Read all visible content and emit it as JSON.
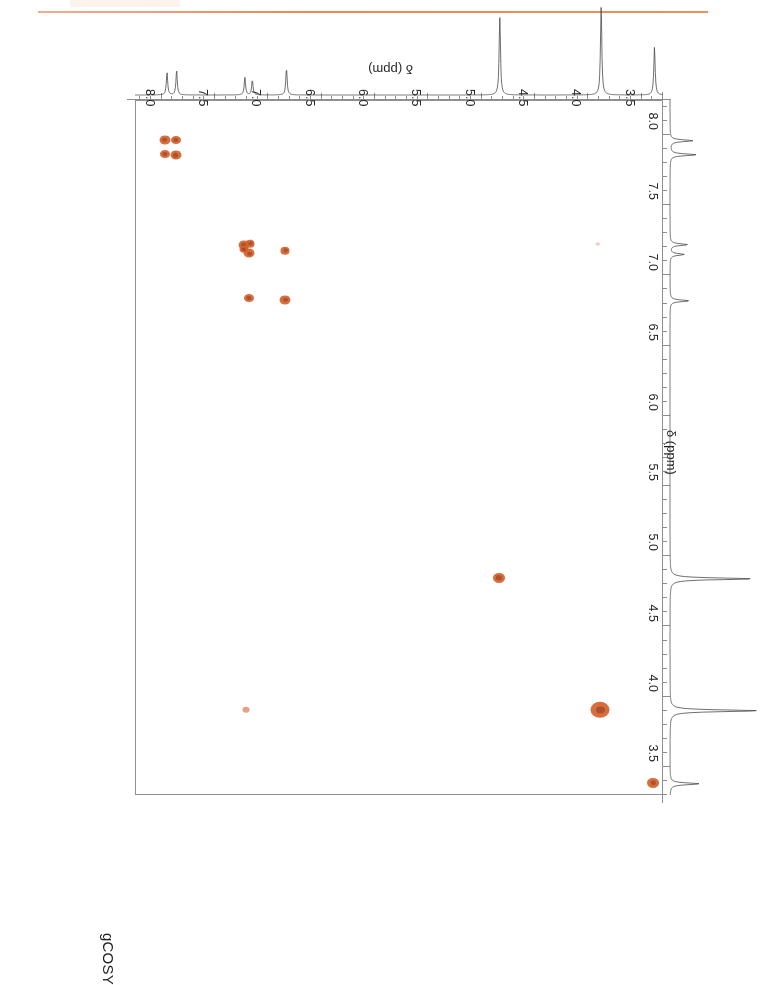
{
  "document": {
    "top_rule_color": "#e8814e"
  },
  "plot": {
    "title": "gCOSY",
    "f2_axis_title": "δ (ppm)",
    "f1_axis_title": "δ (ppm)",
    "peak_color": "#d4622e",
    "peak_core_color": "#a8441c",
    "frame_color": "#8f9092",
    "axis_color": "#8d8e90"
  },
  "chart_data": {
    "type": "heatmap",
    "subtype": "2D NMR gCOSY contour plot",
    "title": "gCOSY",
    "xlabel": "δ (ppm)",
    "ylabel": "δ (ppm)",
    "xlim": [
      3.3,
      8.25
    ],
    "ylim": [
      8.25,
      3.3
    ],
    "x_axis_reversed": true,
    "y_axis_reversed": true,
    "grid": false,
    "legend": false,
    "xticks": [
      3.5,
      4.0,
      4.5,
      5.0,
      5.5,
      6.0,
      6.5,
      7.0,
      7.5,
      8.0
    ],
    "xticklabels": [
      "3.5",
      "4.0",
      "4.5",
      "5.0",
      "5.5",
      "6.0",
      "6.5",
      "7.0",
      "7.5",
      "8.0"
    ],
    "yticks": [
      3.5,
      4.0,
      4.5,
      5.0,
      5.5,
      6.0,
      6.5,
      7.0,
      7.5,
      8.0
    ],
    "yticklabels": [
      "3.5",
      "4.0",
      "4.5",
      "5.0",
      "5.5",
      "6.0",
      "6.5",
      "7.0",
      "7.5",
      "8.0"
    ],
    "minor_tick_interval": 0.1,
    "diagonal_peaks": [
      {
        "f2": 3.38,
        "f1": 3.38,
        "radius": 6.0,
        "intensity": "strong"
      },
      {
        "f2": 3.88,
        "f1": 3.9,
        "radius": 9.5,
        "intensity": "very-strong"
      },
      {
        "f2": 4.83,
        "f1": 4.84,
        "radius": 6.0,
        "intensity": "strong"
      },
      {
        "f2": 6.83,
        "f1": 6.82,
        "radius": 5.5,
        "intensity": "medium"
      },
      {
        "f2": 7.17,
        "f1": 7.15,
        "radius": 5.5,
        "intensity": "medium"
      },
      {
        "f2": 7.22,
        "f1": 7.21,
        "radius": 5.5,
        "intensity": "medium"
      },
      {
        "f2": 7.86,
        "f1": 7.85,
        "radius": 5.5,
        "intensity": "medium"
      },
      {
        "f2": 7.96,
        "f1": 7.96,
        "radius": 5.5,
        "intensity": "medium"
      }
    ],
    "cross_peaks": [
      {
        "f2": 7.2,
        "f1": 3.9,
        "radius": 3.5,
        "intensity": "weak"
      },
      {
        "f2": 6.83,
        "f1": 7.17,
        "radius": 4.5,
        "intensity": "medium"
      },
      {
        "f2": 7.17,
        "f1": 6.83,
        "radius": 5.0,
        "intensity": "medium"
      },
      {
        "f2": 7.22,
        "f1": 7.18,
        "radius": 4.5,
        "intensity": "medium"
      },
      {
        "f2": 7.16,
        "f1": 7.22,
        "radius": 4.5,
        "intensity": "medium"
      },
      {
        "f2": 7.86,
        "f1": 7.96,
        "radius": 5.0,
        "intensity": "medium"
      },
      {
        "f2": 7.96,
        "f1": 7.86,
        "radius": 5.0,
        "intensity": "medium"
      },
      {
        "f2": 3.9,
        "f1": 7.22,
        "radius": 1.8,
        "intensity": "very-weak"
      }
    ],
    "f2_projection_peaks": [
      {
        "shift": 3.38,
        "height": 0.55
      },
      {
        "shift": 3.88,
        "height": 1.0
      },
      {
        "shift": 4.83,
        "height": 0.88
      },
      {
        "shift": 6.83,
        "height": 0.3
      },
      {
        "shift": 7.15,
        "height": 0.17
      },
      {
        "shift": 7.22,
        "height": 0.2
      },
      {
        "shift": 7.86,
        "height": 0.28
      },
      {
        "shift": 7.95,
        "height": 0.26
      }
    ],
    "f1_projection_peaks": [
      {
        "shift": 3.38,
        "height": 0.34
      },
      {
        "shift": 3.9,
        "height": 1.0
      },
      {
        "shift": 4.84,
        "height": 0.95
      },
      {
        "shift": 6.82,
        "height": 0.22
      },
      {
        "shift": 7.15,
        "height": 0.16
      },
      {
        "shift": 7.22,
        "height": 0.2
      },
      {
        "shift": 7.86,
        "height": 0.3
      },
      {
        "shift": 7.96,
        "height": 0.26
      }
    ]
  }
}
